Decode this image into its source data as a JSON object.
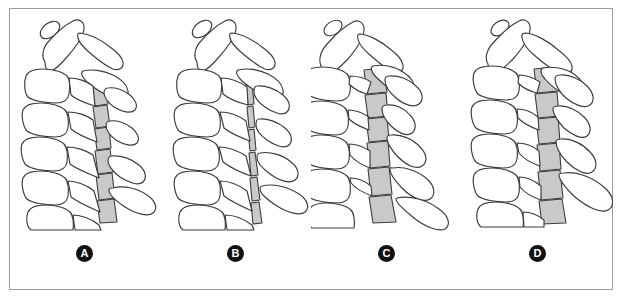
{
  "figure": {
    "type": "medical-line-illustration",
    "panel_count": 4,
    "frame_color": "#9d9d9d",
    "background_color": "#ffffff",
    "outline_color": "#3b3b3b",
    "canal_shade_color": "#c9c9c9",
    "label_badge_color": "#111111",
    "label_text_color": "#ffffff"
  },
  "panels": [
    {
      "id": "panel-a",
      "label": "A",
      "canal_shade": "#c9c9c9",
      "canal_profile": "wide",
      "alignment": "lordotic",
      "vertebra_count": 7
    },
    {
      "id": "panel-b",
      "label": "B",
      "canal_shade": "#c9c9c9",
      "canal_profile": "narrow-sliver",
      "alignment": "lordotic",
      "vertebra_count": 7
    },
    {
      "id": "panel-c",
      "label": "C",
      "canal_shade": "#c9c9c9",
      "canal_profile": "wide-irregular",
      "alignment": "straightened",
      "vertebra_count": 7
    },
    {
      "id": "panel-d",
      "label": "D",
      "canal_shade": "#c9c9c9",
      "canal_profile": "wide-tapering",
      "alignment": "lordotic",
      "vertebra_count": 7
    }
  ]
}
